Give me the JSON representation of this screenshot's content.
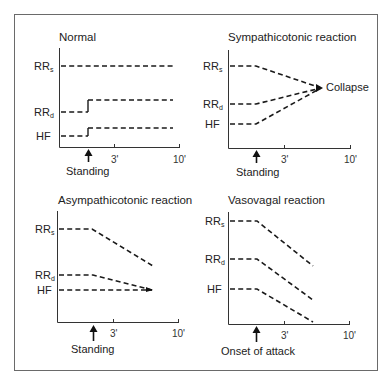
{
  "diagram": {
    "panels": [
      {
        "title": "Normal",
        "series_labels": [
          {
            "main": "RR",
            "sub": "s"
          },
          {
            "main": "RR",
            "sub": "d"
          },
          {
            "main": "HF",
            "sub": ""
          }
        ],
        "x_ticks": [
          "3'",
          "10'"
        ],
        "event": "Standing",
        "description": "RRs stays constant; RRd and HF step up slightly on standing and remain elevated"
      },
      {
        "title": "Sympathicotonic reaction",
        "series_labels": [
          {
            "main": "RR",
            "sub": "s"
          },
          {
            "main": "RR",
            "sub": "d"
          },
          {
            "main": "HF",
            "sub": ""
          }
        ],
        "x_ticks": [
          "3'",
          "10'"
        ],
        "event": "Standing",
        "annotation": "Collapse",
        "description": "RRs falls while RRd and HF rise, all converging at collapse"
      },
      {
        "title": "Asympathicotonic reaction",
        "series_labels": [
          {
            "main": "RR",
            "sub": "s"
          },
          {
            "main": "RR",
            "sub": "d"
          },
          {
            "main": "HF",
            "sub": ""
          }
        ],
        "x_ticks": [
          "3'",
          "10'"
        ],
        "event": "Standing",
        "description": "RRs and RRd fall after standing; HF stays constant"
      },
      {
        "title": "Vasovagal reaction",
        "series_labels": [
          {
            "main": "RR",
            "sub": "s"
          },
          {
            "main": "RR",
            "sub": "d"
          },
          {
            "main": "HF",
            "sub": ""
          }
        ],
        "x_ticks": [
          "3'",
          "10'"
        ],
        "event": "Onset of attack",
        "description": "RRs, RRd and HF all fall in parallel after onset of attack"
      }
    ]
  }
}
